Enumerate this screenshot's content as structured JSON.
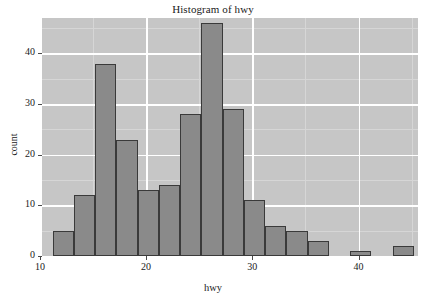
{
  "chart_data": {
    "type": "bar",
    "title": "Histogram of hwy",
    "xlabel": "hwy",
    "ylabel": "count",
    "xlim": [
      10.2,
      45.6
    ],
    "ylim": [
      0,
      47
    ],
    "grid": true,
    "legend": "none",
    "bin_width": 2,
    "categories": [
      "11.2-13.2",
      "13.2-15.2",
      "15.2-17.2",
      "17.2-19.2",
      "19.2-21.2",
      "21.2-23.2",
      "23.2-25.2",
      "25.2-27.2",
      "27.2-29.2",
      "29.2-31.2",
      "31.2-33.2",
      "33.2-35.2",
      "35.2-37.2",
      "37.2-39.2",
      "39.2-41.2",
      "41.2-43.2",
      "43.2-45.2"
    ],
    "bin_starts": [
      11.2,
      13.2,
      15.2,
      17.2,
      19.2,
      21.2,
      23.2,
      25.2,
      27.2,
      29.2,
      31.2,
      33.2,
      35.2,
      37.2,
      39.2,
      41.2,
      43.2
    ],
    "values": [
      5,
      12,
      38,
      23,
      13,
      14,
      28,
      46,
      29,
      11,
      6,
      5,
      3,
      0,
      1,
      0,
      2
    ],
    "x_ticks": [
      10,
      20,
      30,
      40
    ],
    "x_tick_labels": [
      "10",
      "20",
      "30",
      "40"
    ],
    "y_ticks": [
      0,
      10,
      20,
      30,
      40
    ],
    "y_tick_labels": [
      "0",
      "10",
      "20",
      "30",
      "40"
    ],
    "colors": {
      "panel_background": "#c6c6c6",
      "gridline_major": "#ffffff",
      "gridline_minor": "#d6d6d6",
      "bar_fill": "#8a8a8a",
      "bar_border": "#3a3a3a",
      "text": "#1a1a1a",
      "page_background": "#ffffff"
    }
  }
}
